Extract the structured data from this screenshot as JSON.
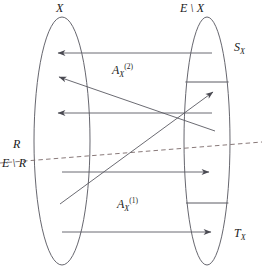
{
  "figure": {
    "type": "set-mapping-diagram",
    "width": 262,
    "height": 273,
    "background": "#ffffff",
    "ink_color": "#4a4a52",
    "text_color": "#1a1a1a"
  },
  "labels": {
    "left_set": "X",
    "right_set": "E \\ X",
    "right_top_region": "S",
    "right_top_region_sub": "X",
    "right_bottom_region": "T",
    "right_bottom_region_sub": "X",
    "arrows_upper_group": "A",
    "arrows_upper_group_sup": "(2)",
    "arrows_upper_group_sub": "X",
    "arrows_lower_group": "A",
    "arrows_lower_group_sup": "(1)",
    "arrows_lower_group_sub": "X",
    "region_above_dashed": "R",
    "region_below_dashed": "E \\ R"
  },
  "shapes": {
    "left_ellipse": {
      "cx": 62,
      "cy": 141,
      "rx": 28,
      "ry": 124
    },
    "right_ellipse": {
      "cx": 207,
      "cy": 141,
      "rx": 23,
      "ry": 124
    },
    "right_divider_top_y": 82,
    "right_divider_bottom_y": 203,
    "dashed_line": {
      "x1": 0,
      "y1": 163,
      "x2": 262,
      "y2": 142
    }
  },
  "arrows": [
    {
      "name": "arrow-right-to-left-top",
      "x1": 212,
      "y1": 53,
      "x2": 57,
      "y2": 53,
      "direction": "left"
    },
    {
      "name": "arrow-right-to-left-middle",
      "x1": 212,
      "y1": 113,
      "x2": 57,
      "y2": 113,
      "direction": "left"
    },
    {
      "name": "arrow-diagonal-up-left",
      "x1": 215,
      "y1": 130,
      "x2": 58,
      "y2": 77,
      "direction": "left"
    },
    {
      "name": "arrow-diagonal-up-right",
      "x1": 62,
      "y1": 203,
      "x2": 212,
      "y2": 93,
      "direction": "right"
    },
    {
      "name": "arrow-left-to-right-lower",
      "x1": 62,
      "y1": 172,
      "x2": 208,
      "y2": 172,
      "direction": "right"
    },
    {
      "name": "arrow-left-to-right-bottom",
      "x1": 62,
      "y1": 232,
      "x2": 210,
      "y2": 232,
      "direction": "right"
    }
  ]
}
